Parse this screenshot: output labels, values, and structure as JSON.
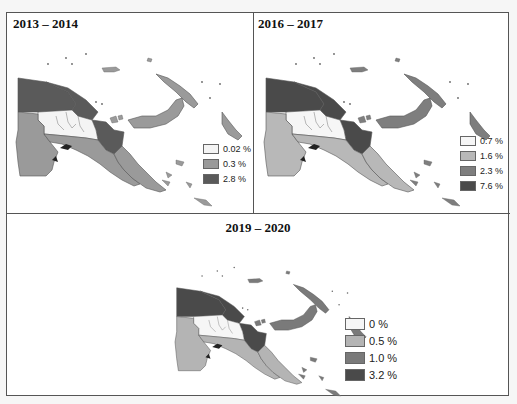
{
  "figure": {
    "panels": [
      {
        "title": "2013 – 2014",
        "legend": [
          {
            "label": "0.02 %",
            "color": "#f4f4f4"
          },
          {
            "label": "0.3 %",
            "color": "#9a9a9a"
          },
          {
            "label": "2.8 %",
            "color": "#5a5a5a"
          }
        ],
        "region_classes": {
          "northwest": 2,
          "north_coast": 2,
          "east_sepik_morobe": 2,
          "highlands": 0,
          "western": 1,
          "gulf_central": 1,
          "southeast": 1,
          "new_britain": 1,
          "new_ireland": 1,
          "bougainville": 1
        }
      },
      {
        "title": "2016 – 2017",
        "legend": [
          {
            "label": "0.7 %",
            "color": "#f6f6f6"
          },
          {
            "label": "1.6 %",
            "color": "#b8b8b8"
          },
          {
            "label": "2.3 %",
            "color": "#7e7e7e"
          },
          {
            "label": "7.6 %",
            "color": "#4a4a4a"
          }
        ],
        "region_classes": {
          "northwest": 3,
          "north_coast": 3,
          "east_sepik_morobe": 3,
          "highlands": 0,
          "western": 1,
          "gulf_central": 1,
          "southeast": 1,
          "new_britain": 2,
          "new_ireland": 2,
          "bougainville": 2
        }
      },
      {
        "title": "2019 – 2020",
        "legend": [
          {
            "label": "0 %",
            "color": "#f6f6f6"
          },
          {
            "label": "0.5 %",
            "color": "#b4b4b4"
          },
          {
            "label": "1.0 %",
            "color": "#7a7a7a"
          },
          {
            "label": "3.2 %",
            "color": "#4a4a4a"
          }
        ],
        "region_classes": {
          "northwest": 3,
          "north_coast": 3,
          "east_sepik_morobe": 3,
          "highlands": 0,
          "western": 1,
          "gulf_central": 1,
          "southeast": 1,
          "new_britain": 2,
          "new_ireland": 2,
          "bougainville": 2
        }
      }
    ]
  }
}
